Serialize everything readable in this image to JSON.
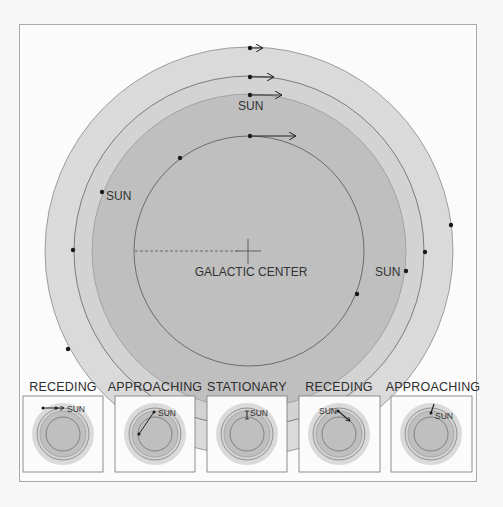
{
  "diagram": {
    "center_label": "GALACTIC CENTER",
    "sun_label": "SUN",
    "colors": {
      "background": "#fbfbfb",
      "outer_ring": "#dadada",
      "middle_ring": "#d2d2d2",
      "inner_disk": "#bebebe",
      "orbit_line": "#555555",
      "dot": "#1a1a1a"
    },
    "main_sun_labels": [
      {
        "text": "SUN",
        "position": "top"
      },
      {
        "text": "SUN",
        "position": "left"
      },
      {
        "text": "SUN",
        "position": "right"
      }
    ]
  },
  "panels": [
    {
      "title": "RECEDING",
      "sun_label": "SUN",
      "motion": "receding"
    },
    {
      "title": "APPROACHING",
      "sun_label": "SUN",
      "motion": "approaching"
    },
    {
      "title": "STATIONARY",
      "sun_label": "SUN",
      "motion": "stationary"
    },
    {
      "title": "RECEDING",
      "sun_label": "SUN",
      "motion": "receding"
    },
    {
      "title": "APPROACHING",
      "sun_label": "SUN",
      "motion": "approaching"
    }
  ]
}
